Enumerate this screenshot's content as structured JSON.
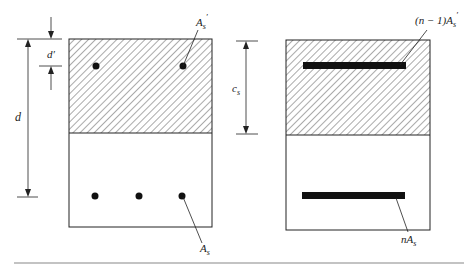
{
  "diagram": {
    "left_section": {
      "labels": {
        "d": "d",
        "d_prime": "d′",
        "As_prime": "A",
        "As_prime_sub": "s",
        "As_prime_sup": "′",
        "As": "A",
        "As_sub": "s"
      },
      "top_bars_count": 2,
      "bottom_bars_count": 3
    },
    "right_section": {
      "labels": {
        "cs": "c",
        "cs_sub": "s",
        "top_bar": "(n − 1)A",
        "top_bar_sub": "s",
        "top_bar_sup": "′",
        "bottom_bar": "nA",
        "bottom_bar_sub": "s"
      }
    },
    "colors": {
      "line": "#222222",
      "hatch": "#555555",
      "bar": "#111111",
      "rule": "#888888"
    }
  }
}
